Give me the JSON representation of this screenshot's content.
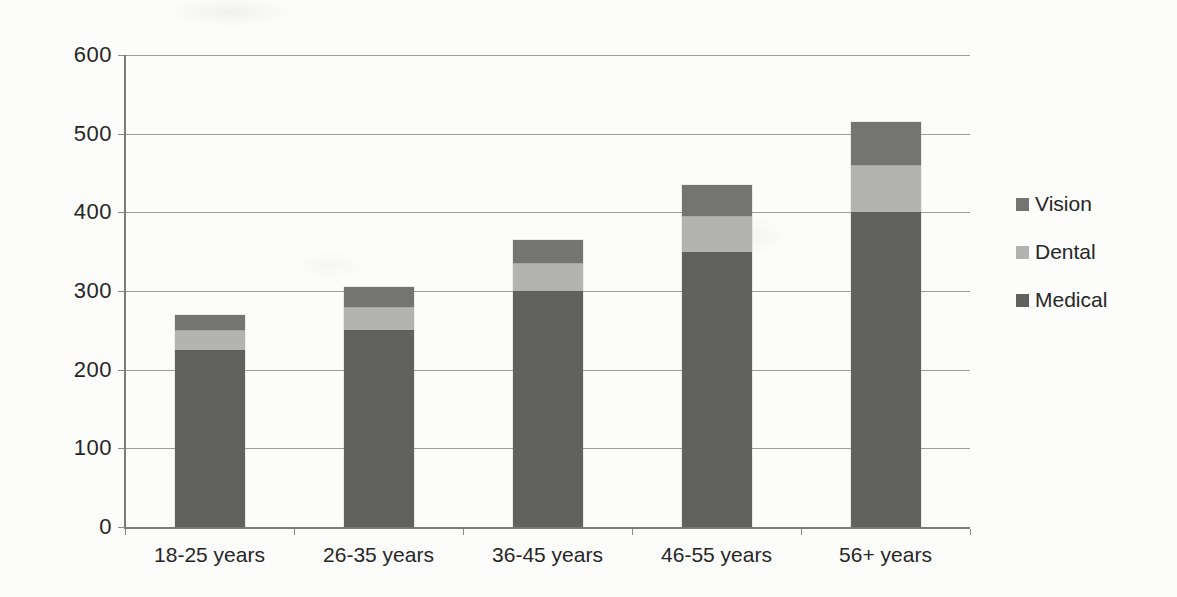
{
  "chart_data": {
    "type": "bar",
    "stacked": true,
    "title": "",
    "xlabel": "",
    "ylabel": "",
    "categories": [
      "18-25 years",
      "26-35 years",
      "36-45 years",
      "46-55 years",
      "56+ years"
    ],
    "series": [
      {
        "name": "Medical",
        "color": "#616160",
        "values": [
          225,
          250,
          300,
          350,
          400
        ]
      },
      {
        "name": "Dental",
        "color": "#b3b3b1",
        "values": [
          25,
          30,
          35,
          45,
          60
        ]
      },
      {
        "name": "Vision",
        "color": "#747473",
        "values": [
          20,
          25,
          30,
          40,
          55
        ]
      }
    ],
    "totals": [
      270,
      305,
      365,
      435,
      515
    ],
    "ylim": [
      0,
      600
    ],
    "ytick_step": 100,
    "yticks": [
      "0",
      "100",
      "200",
      "300",
      "400",
      "500",
      "600"
    ],
    "grid": true,
    "legend_position": "right",
    "legend_order": [
      "Vision",
      "Dental",
      "Medical"
    ]
  },
  "colors": {
    "background": "#fcfcfa",
    "gridline": "#9d9d9b",
    "axis": "#7b7b79",
    "text": "#262626"
  }
}
